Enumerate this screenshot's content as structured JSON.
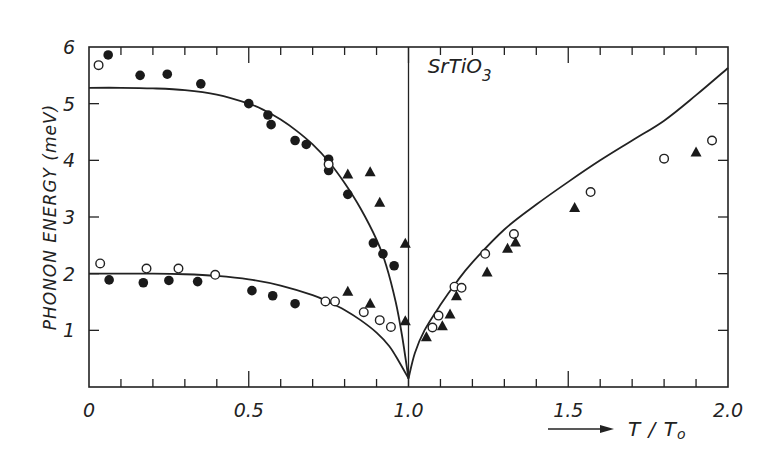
{
  "chart_data": {
    "type": "scatter",
    "title": "",
    "annotation": {
      "text": "SrTiO",
      "subscript": "3",
      "x": 1.06,
      "y": 5.55
    },
    "xlabel": "T / T",
    "xlabel_subscript": "o",
    "xlabel_arrow": true,
    "ylabel": "PHONON ENERGY  (meV)",
    "xlim": [
      0,
      2.0
    ],
    "ylim": [
      0,
      6
    ],
    "x_ticks": [
      0,
      0.5,
      1.0,
      1.5,
      2.0
    ],
    "x_tick_labels": [
      "0",
      "0.5",
      "1.0",
      "1.5",
      "2.0"
    ],
    "x_minor_step": 0.1,
    "y_ticks": [
      1,
      2,
      3,
      4,
      5,
      6
    ],
    "y_tick_labels": [
      "1",
      "2",
      "3",
      "4",
      "5",
      "6"
    ],
    "grid": false,
    "vertical_line_x": 1.0,
    "legend": null,
    "curves": [
      {
        "name": "upper-branch-fit",
        "points": [
          [
            0,
            5.28
          ],
          [
            0.1,
            5.28
          ],
          [
            0.2,
            5.27
          ],
          [
            0.3,
            5.24
          ],
          [
            0.4,
            5.16
          ],
          [
            0.5,
            5.0
          ],
          [
            0.55,
            4.88
          ],
          [
            0.6,
            4.72
          ],
          [
            0.65,
            4.52
          ],
          [
            0.7,
            4.28
          ],
          [
            0.75,
            3.98
          ],
          [
            0.8,
            3.6
          ],
          [
            0.85,
            3.15
          ],
          [
            0.9,
            2.6
          ],
          [
            0.93,
            2.15
          ],
          [
            0.96,
            1.5
          ],
          [
            0.98,
            0.9
          ],
          [
            1.0,
            0.15
          ]
        ]
      },
      {
        "name": "lower-branch-fit",
        "points": [
          [
            0,
            2.0
          ],
          [
            0.2,
            2.0
          ],
          [
            0.3,
            1.99
          ],
          [
            0.4,
            1.96
          ],
          [
            0.5,
            1.9
          ],
          [
            0.6,
            1.79
          ],
          [
            0.7,
            1.62
          ],
          [
            0.75,
            1.5
          ],
          [
            0.8,
            1.36
          ],
          [
            0.85,
            1.18
          ],
          [
            0.9,
            0.96
          ],
          [
            0.94,
            0.72
          ],
          [
            0.97,
            0.45
          ],
          [
            1.0,
            0.15
          ]
        ]
      },
      {
        "name": "high-temperature-fit",
        "points": [
          [
            1.0,
            0.15
          ],
          [
            1.02,
            0.6
          ],
          [
            1.05,
            1.0
          ],
          [
            1.1,
            1.45
          ],
          [
            1.15,
            1.85
          ],
          [
            1.2,
            2.2
          ],
          [
            1.3,
            2.78
          ],
          [
            1.4,
            3.22
          ],
          [
            1.5,
            3.62
          ],
          [
            1.6,
            4.0
          ],
          [
            1.7,
            4.35
          ],
          [
            1.8,
            4.7
          ],
          [
            1.9,
            5.15
          ],
          [
            2.0,
            5.63
          ]
        ]
      }
    ],
    "series": [
      {
        "name": "filled-circles",
        "marker": "filled-circle",
        "points": [
          [
            0.06,
            5.86
          ],
          [
            0.16,
            5.5
          ],
          [
            0.245,
            5.52
          ],
          [
            0.35,
            5.35
          ],
          [
            0.5,
            5.0
          ],
          [
            0.56,
            4.8
          ],
          [
            0.57,
            4.63
          ],
          [
            0.645,
            4.35
          ],
          [
            0.68,
            4.28
          ],
          [
            0.75,
            4.02
          ],
          [
            0.75,
            3.82
          ],
          [
            0.81,
            3.4
          ],
          [
            0.89,
            2.54
          ],
          [
            0.92,
            2.35
          ],
          [
            0.955,
            2.14
          ],
          [
            0.063,
            1.89
          ],
          [
            0.17,
            1.84
          ],
          [
            0.25,
            1.88
          ],
          [
            0.34,
            1.86
          ],
          [
            0.51,
            1.7
          ],
          [
            0.575,
            1.61
          ],
          [
            0.645,
            1.47
          ]
        ]
      },
      {
        "name": "open-circles",
        "marker": "open-circle",
        "points": [
          [
            0.03,
            5.68
          ],
          [
            0.75,
            3.93
          ],
          [
            0.035,
            2.18
          ],
          [
            0.18,
            2.09
          ],
          [
            0.28,
            2.09
          ],
          [
            0.395,
            1.98
          ],
          [
            0.74,
            1.51
          ],
          [
            0.77,
            1.51
          ],
          [
            0.86,
            1.32
          ],
          [
            0.91,
            1.18
          ],
          [
            0.945,
            1.06
          ],
          [
            1.075,
            1.05
          ],
          [
            1.094,
            1.26
          ],
          [
            1.144,
            1.77
          ],
          [
            1.166,
            1.75
          ],
          [
            1.24,
            2.35
          ],
          [
            1.33,
            2.7
          ],
          [
            1.57,
            3.44
          ],
          [
            1.8,
            4.03
          ],
          [
            1.95,
            4.35
          ]
        ]
      },
      {
        "name": "filled-triangles",
        "marker": "filled-triangle",
        "points": [
          [
            0.81,
            3.75
          ],
          [
            0.88,
            3.79
          ],
          [
            0.91,
            3.25
          ],
          [
            0.99,
            2.53
          ],
          [
            0.81,
            1.68
          ],
          [
            0.88,
            1.47
          ],
          [
            0.99,
            1.16
          ],
          [
            1.056,
            0.88
          ],
          [
            1.106,
            1.07
          ],
          [
            1.13,
            1.28
          ],
          [
            1.15,
            1.6
          ],
          [
            1.246,
            2.02
          ],
          [
            1.31,
            2.44
          ],
          [
            1.335,
            2.55
          ],
          [
            1.52,
            3.16
          ],
          [
            1.9,
            4.14
          ]
        ]
      }
    ]
  }
}
